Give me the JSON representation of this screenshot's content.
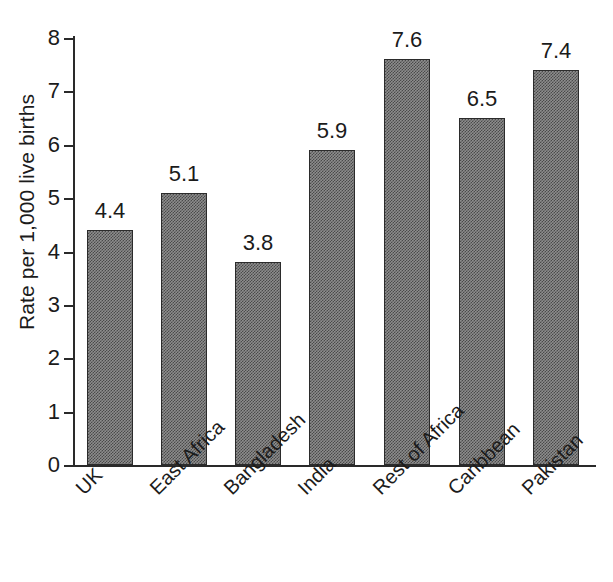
{
  "chart_data": {
    "type": "bar",
    "title": "",
    "xlabel": "",
    "ylabel": "Rate per 1,000 live births",
    "ylim": [
      0,
      8
    ],
    "yticks": [
      "0",
      "1",
      "2",
      "3",
      "4",
      "5",
      "6",
      "7",
      "8"
    ],
    "grid": false,
    "legend": "none",
    "categories": [
      "UK",
      "East Africa",
      "Bangladesh",
      "India",
      "Rest of Africa",
      "Caribbean",
      "Pakistan"
    ],
    "values": [
      4.4,
      5.1,
      3.8,
      5.9,
      7.6,
      6.5,
      7.4
    ],
    "value_labels": [
      "4.4",
      "5.1",
      "3.8",
      "5.9",
      "7.6",
      "6.5",
      "7.4"
    ],
    "bar_color": "#7f7f7f",
    "bar_edge_color": "#2b2b2b",
    "axis_color": "#2a2a2a"
  },
  "ylabel": "Rate per 1,000 live births",
  "yticks": [
    {
      "label": "8",
      "value": 8
    },
    {
      "label": "7",
      "value": 7
    },
    {
      "label": "6",
      "value": 6
    },
    {
      "label": "5",
      "value": 5
    },
    {
      "label": "4",
      "value": 4
    },
    {
      "label": "3",
      "value": 3
    },
    {
      "label": "2",
      "value": 2
    },
    {
      "label": "1",
      "value": 1
    },
    {
      "label": "0",
      "value": 0
    }
  ],
  "bars": [
    {
      "category": "UK",
      "value_label": "4.4"
    },
    {
      "category": "East Africa",
      "value_label": "5.1"
    },
    {
      "category": "Bangladesh",
      "value_label": "3.8"
    },
    {
      "category": "India",
      "value_label": "5.9"
    },
    {
      "category": "Rest of Africa",
      "value_label": "7.6"
    },
    {
      "category": "Caribbean",
      "value_label": "6.5"
    },
    {
      "category": "Pakistan",
      "value_label": "7.4"
    }
  ]
}
